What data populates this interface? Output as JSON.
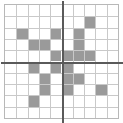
{
  "figure": {
    "name": "pixel-grid-plot",
    "type": "heatmap-grid",
    "columns": 10,
    "rows": 10,
    "background_color": "#ffffff",
    "gridline_color": "#c9c9c9",
    "frame_color": "#b8b8b8",
    "filled_color": "#9a9a9a",
    "axis_color": "#5a5a5a",
    "axis_vertical_after_column": 5,
    "axis_horizontal_after_row": 5
  },
  "chart_data": {
    "type": "heatmap",
    "title": "",
    "xlabel": "",
    "ylabel": "",
    "x": [
      1,
      2,
      3,
      4,
      5,
      6,
      7,
      8,
      9,
      10
    ],
    "y": [
      1,
      2,
      3,
      4,
      5,
      6,
      7,
      8,
      9,
      10
    ],
    "xlim": [
      0,
      10
    ],
    "ylim": [
      0,
      10
    ],
    "grid": true,
    "legend": "none",
    "xticklabels": [
      "",
      "",
      "",
      "",
      "",
      "",
      "",
      "",
      "",
      ""
    ],
    "yticklabels": [
      "",
      "",
      "",
      "",
      "",
      "",
      "",
      "",
      "",
      ""
    ],
    "value_levels": {
      "empty": 0,
      "filled": 1
    },
    "matrix": [
      [
        0,
        0,
        0,
        0,
        0,
        0,
        0,
        0,
        0,
        0
      ],
      [
        0,
        0,
        0,
        0,
        0,
        0,
        0,
        1,
        0,
        0
      ],
      [
        0,
        1,
        0,
        0,
        1,
        0,
        1,
        0,
        0,
        0
      ],
      [
        0,
        0,
        1,
        1,
        0,
        0,
        1,
        0,
        0,
        0
      ],
      [
        0,
        0,
        0,
        0,
        1,
        1,
        1,
        1,
        0,
        0
      ],
      [
        0,
        0,
        1,
        0,
        1,
        1,
        0,
        0,
        0,
        0
      ],
      [
        0,
        0,
        0,
        1,
        0,
        1,
        1,
        0,
        0,
        0
      ],
      [
        0,
        0,
        0,
        1,
        0,
        1,
        0,
        0,
        1,
        0
      ],
      [
        0,
        0,
        1,
        0,
        0,
        0,
        0,
        0,
        0,
        0
      ],
      [
        0,
        0,
        0,
        0,
        0,
        0,
        0,
        0,
        0,
        0
      ]
    ]
  }
}
